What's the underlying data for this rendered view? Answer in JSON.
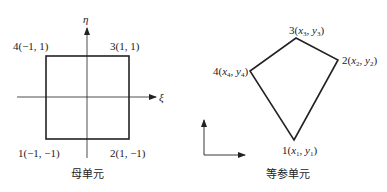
{
  "left_diagram": {
    "caption": "母单元",
    "axis_eta_label": "η",
    "axis_xi_label": "ξ",
    "nodes": [
      {
        "id": "1",
        "label": "1(−1, −1)"
      },
      {
        "id": "2",
        "label": "2(1, −1)"
      },
      {
        "id": "3",
        "label": "3(1, 1)"
      },
      {
        "id": "4",
        "label": "4(−1, 1)"
      }
    ]
  },
  "right_diagram": {
    "caption": "等参单元",
    "nodes": [
      {
        "id": "1",
        "num": "1",
        "x": "x",
        "xs": "1",
        "y": "y",
        "ys": "1"
      },
      {
        "id": "2",
        "num": "2",
        "x": "x",
        "xs": "2",
        "y": "y",
        "ys": "2"
      },
      {
        "id": "3",
        "num": "3",
        "x": "x",
        "xs": "3",
        "y": "y",
        "ys": "3"
      },
      {
        "id": "4",
        "num": "4",
        "x": "x",
        "xs": "4",
        "y": "y",
        "ys": "4"
      }
    ]
  },
  "colors": {
    "line": "#222222",
    "background": "#ffffff"
  }
}
